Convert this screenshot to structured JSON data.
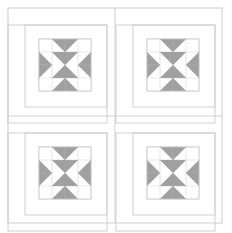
{
  "document": {
    "title": "Quilt Block Layout Diagram",
    "type": "quilt-pattern-diagram",
    "width": 232,
    "height": 233,
    "background_color": "#ffffff"
  },
  "colors": {
    "background": "#ffffff",
    "patch_fill": "#a0a0a0",
    "patch_fill_alt": "#ffffff",
    "outline": "#c8c8c8",
    "frame_line": "#d0d0d0",
    "outer_border": "#cccccc",
    "star_stroke": "#b0b0b0"
  },
  "layout": {
    "outer_border": {
      "x": 8,
      "y": 8,
      "width": 214,
      "height": 215,
      "stroke_width": 1
    },
    "grid": {
      "rows": 2,
      "cols": 2,
      "divider_x": 115,
      "divider_y": 116
    },
    "quadrant_labels": [
      "top-left",
      "top-right",
      "bottom-left",
      "bottom-right"
    ]
  },
  "quadrants": [
    {
      "name": "top-left",
      "origin_x": 8,
      "origin_y": 8,
      "sashing_frame": {
        "x": 8,
        "y": 25,
        "width": 99,
        "height": 98
      },
      "inner_frame": {
        "x": 25,
        "y": 25,
        "width": 82,
        "height": 82
      },
      "star_block": {
        "x": 39,
        "y": 39,
        "size": 52,
        "units": 4
      }
    },
    {
      "name": "top-right",
      "origin_x": 116,
      "origin_y": 8,
      "sashing_frame": {
        "x": 116,
        "y": 25,
        "width": 99,
        "height": 98
      },
      "inner_frame": {
        "x": 133,
        "y": 25,
        "width": 82,
        "height": 82
      },
      "star_block": {
        "x": 147,
        "y": 39,
        "size": 52,
        "units": 4
      }
    },
    {
      "name": "bottom-left",
      "origin_x": 8,
      "origin_y": 116,
      "sashing_frame": {
        "x": 8,
        "y": 133,
        "width": 99,
        "height": 98
      },
      "inner_frame": {
        "x": 25,
        "y": 133,
        "width": 82,
        "height": 82
      },
      "star_block": {
        "x": 39,
        "y": 147,
        "size": 52,
        "units": 4
      }
    },
    {
      "name": "bottom-right",
      "origin_x": 116,
      "origin_y": 116,
      "sashing_frame": {
        "x": 116,
        "y": 133,
        "width": 99,
        "height": 98
      },
      "inner_frame": {
        "x": 133,
        "y": 133,
        "width": 82,
        "height": 82
      },
      "star_block": {
        "x": 147,
        "y": 147,
        "size": 52,
        "units": 4
      }
    }
  ],
  "star_block_spec": {
    "name": "eight-pointed-variable-star",
    "grid_units": 4,
    "description": "4x4 unit sawtooth star: corner squares plain, edge units are split half-square triangle pairs forming star points, center 2x2 is an hourglass of four triangles",
    "cells": [
      {
        "row": 0,
        "col": 0,
        "type": "plain",
        "fill": "background"
      },
      {
        "row": 0,
        "col": 1,
        "type": "flying-geese-left",
        "fill": "patch"
      },
      {
        "row": 0,
        "col": 2,
        "type": "flying-geese-right",
        "fill": "patch"
      },
      {
        "row": 0,
        "col": 3,
        "type": "plain",
        "fill": "background"
      },
      {
        "row": 1,
        "col": 0,
        "type": "flying-geese-top",
        "fill": "patch"
      },
      {
        "row": 1,
        "col": 1,
        "type": "hourglass-quarter-tl",
        "fill": "patch"
      },
      {
        "row": 1,
        "col": 2,
        "type": "hourglass-quarter-tr",
        "fill": "patch"
      },
      {
        "row": 1,
        "col": 3,
        "type": "flying-geese-top",
        "fill": "patch"
      },
      {
        "row": 2,
        "col": 0,
        "type": "flying-geese-bottom",
        "fill": "patch"
      },
      {
        "row": 2,
        "col": 1,
        "type": "hourglass-quarter-bl",
        "fill": "patch"
      },
      {
        "row": 2,
        "col": 2,
        "type": "hourglass-quarter-br",
        "fill": "patch"
      },
      {
        "row": 2,
        "col": 3,
        "type": "flying-geese-bottom",
        "fill": "patch"
      },
      {
        "row": 3,
        "col": 0,
        "type": "plain",
        "fill": "background"
      },
      {
        "row": 3,
        "col": 1,
        "type": "flying-geese-left",
        "fill": "patch"
      },
      {
        "row": 3,
        "col": 2,
        "type": "flying-geese-right",
        "fill": "patch"
      },
      {
        "row": 3,
        "col": 3,
        "type": "plain",
        "fill": "background"
      }
    ]
  }
}
